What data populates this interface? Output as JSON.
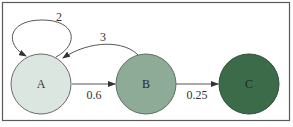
{
  "diagram": {
    "type": "state-transition",
    "frame": {
      "stroke": "#5a5a5a"
    },
    "nodes": [
      {
        "id": "A",
        "label": "A",
        "fill": "#dbe6e1",
        "stroke": "#6a6a6a",
        "text_color": "#333333"
      },
      {
        "id": "B",
        "label": "B",
        "fill": "#8eab98",
        "stroke": "#5f6f64",
        "text_color": "#2a2a2a"
      },
      {
        "id": "C",
        "label": "C",
        "fill": "#3c6b49",
        "stroke": "#2f4f37",
        "text_color": "#1c2a1f"
      }
    ],
    "edges": [
      {
        "from": "A",
        "to": "A",
        "label": "2"
      },
      {
        "from": "B",
        "to": "A",
        "label": "3"
      },
      {
        "from": "A",
        "to": "B",
        "label": "0.6"
      },
      {
        "from": "B",
        "to": "C",
        "label": "0.25"
      }
    ]
  }
}
